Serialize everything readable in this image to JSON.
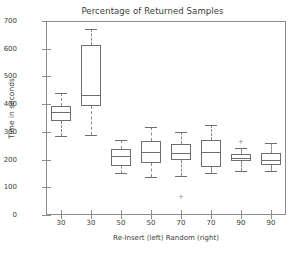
{
  "chart_data": {
    "type": "box",
    "title": "Percentage of Returned Samples",
    "xlabel": "Re-Insert (left)   Random (right)",
    "ylabel": "Time in seconds",
    "ylim": [
      0,
      700
    ],
    "yticks": [
      0,
      100,
      200,
      300,
      400,
      500,
      600,
      700
    ],
    "grid": false,
    "legend": null,
    "categories": [
      "30",
      "30",
      "50",
      "50",
      "70",
      "70",
      "90",
      "90"
    ],
    "boxes": [
      {
        "label": "30",
        "whisker_low": 285,
        "q1": 340,
        "median": 370,
        "q3": 395,
        "whisker_high": 440,
        "fliers": []
      },
      {
        "label": "30",
        "whisker_low": 288,
        "q1": 395,
        "median": 432,
        "q3": 612,
        "whisker_high": 670,
        "fliers": []
      },
      {
        "label": "50",
        "whisker_low": 152,
        "q1": 178,
        "median": 212,
        "q3": 238,
        "whisker_high": 270,
        "fliers": []
      },
      {
        "label": "50",
        "whisker_low": 136,
        "q1": 186,
        "median": 228,
        "q3": 268,
        "whisker_high": 318,
        "fliers": []
      },
      {
        "label": "70",
        "whisker_low": 141,
        "q1": 197,
        "median": 222,
        "q3": 257,
        "whisker_high": 300,
        "fliers": [
          65
        ]
      },
      {
        "label": "70",
        "whisker_low": 152,
        "q1": 172,
        "median": 226,
        "q3": 272,
        "whisker_high": 325,
        "fliers": []
      },
      {
        "label": "90",
        "whisker_low": 160,
        "q1": 196,
        "median": 206,
        "q3": 220,
        "whisker_high": 243,
        "fliers": [
          262
        ]
      },
      {
        "label": "90",
        "whisker_low": 158,
        "q1": 182,
        "median": 200,
        "q3": 223,
        "whisker_high": 258,
        "fliers": []
      }
    ],
    "colors": {
      "box_edge": "#6e6e6e",
      "whisker": "#8a8a8a",
      "axis": "#8d8d8d",
      "text": "#3c3c3c",
      "background": "#ffffff"
    }
  }
}
